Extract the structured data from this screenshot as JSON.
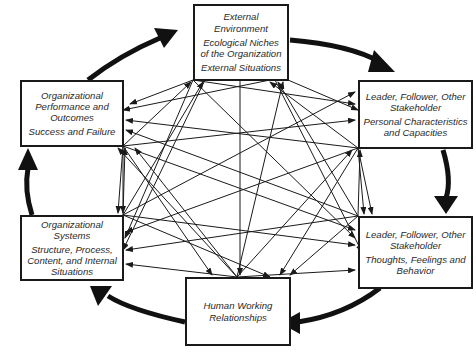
{
  "diagram": {
    "colors": {
      "line": "#1a1a1a",
      "text": "#2a2a2a",
      "background": "#ffffff"
    },
    "nodes": [
      {
        "id": "external",
        "heading": "External Environment",
        "detail": "Ecological Niches of the Organization",
        "detail2": "External Situations"
      },
      {
        "id": "personal",
        "heading": "Leader, Follower, Other Stakeholder",
        "detail": "Personal Characteristics and Capacities"
      },
      {
        "id": "thoughts",
        "heading": "Leader, Follower, Other Stakeholder",
        "detail": "Thoughts, Feelings and Behavior"
      },
      {
        "id": "relationships",
        "heading": "Human Working Relationships"
      },
      {
        "id": "systems",
        "heading": "Organizational Systems",
        "detail": "Structure, Process, Content, and Internal Situations"
      },
      {
        "id": "performance",
        "heading": "Organizational Performance and Outcomes",
        "detail": "Success and Failure"
      }
    ],
    "cycle": [
      "external",
      "personal",
      "thoughts",
      "relationships",
      "systems",
      "performance",
      "external"
    ],
    "interconnections": "all nodes bidirectionally connected"
  }
}
